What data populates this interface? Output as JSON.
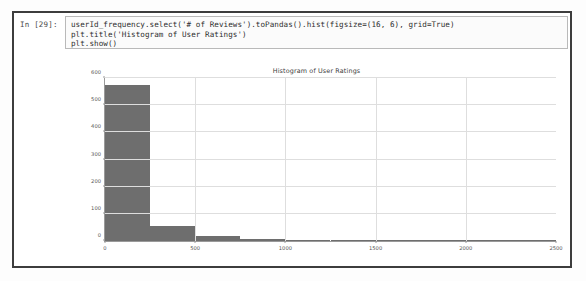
{
  "notebook": {
    "prompt": "In [29]:",
    "code_lines": [
      "userId_frequency.select('# of Reviews').toPandas().hist(figsize=(16, 6), grid=True)",
      "plt.title('Histogram of User Ratings')",
      "plt.show()"
    ]
  },
  "colors": {
    "bar": "#6e6e6e",
    "grid": "#dedede",
    "axis": "#9a9a9a",
    "cell_border": "#3d3d3d"
  },
  "chart_data": {
    "type": "bar",
    "title": "Histogram of User Ratings",
    "xlabel": "",
    "ylabel": "",
    "grid": true,
    "legend": false,
    "xlim": [
      0,
      2500
    ],
    "ylim": [
      0,
      600
    ],
    "xticks": [
      "0",
      "500",
      "1000",
      "1500",
      "2000",
      "2500"
    ],
    "xtick_values": [
      0,
      500,
      1000,
      1500,
      2000,
      2500
    ],
    "yticks": [
      "0",
      "100",
      "200",
      "300",
      "400",
      "500",
      "600"
    ],
    "ytick_values": [
      0,
      100,
      200,
      300,
      400,
      500,
      600
    ],
    "bin_width": 250,
    "bin_edges": [
      0,
      250,
      500,
      750,
      1000,
      1250,
      1500,
      1750,
      2000,
      2250,
      2500
    ],
    "categories": [
      "0-250",
      "250-500",
      "500-750",
      "750-1000",
      "1000-1250",
      "1250-1500",
      "1500-1750",
      "1750-2000",
      "2000-2250",
      "2250-2500"
    ],
    "values": [
      575,
      55,
      18,
      6,
      3,
      2,
      2,
      3,
      1,
      1
    ]
  }
}
